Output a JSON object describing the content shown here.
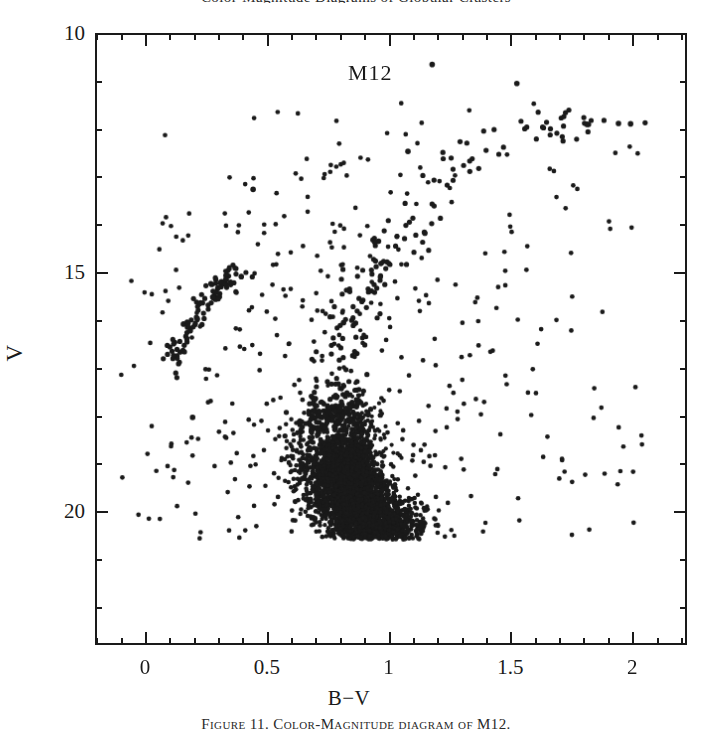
{
  "figure": {
    "caption_top": "Color-Magnitude Diagrams of Globular Clusters",
    "caption_bottom": "Figure 11. Color-Magnitude diagram of M12."
  },
  "annotations": {
    "cluster_name": "M12"
  },
  "axes": {
    "x": {
      "label": "B−V",
      "tick_labels": [
        "0",
        "0.5",
        "1",
        "1.5",
        "2"
      ],
      "tick_values": [
        0,
        0.5,
        1,
        1.5,
        2
      ],
      "minor_per_major": 5,
      "range": [
        -0.205,
        2.225
      ]
    },
    "y": {
      "label": "V",
      "tick_labels": [
        "10",
        "15",
        "20"
      ],
      "tick_values": [
        10,
        15,
        20
      ],
      "minor_per_major": 5,
      "range": [
        10.0,
        22.8
      ],
      "inverted": true
    }
  },
  "style": {
    "frame_color": "#1a1a1a",
    "point_color": "#1a1a1a",
    "background": "#ffffff",
    "point_radius": 2.6
  },
  "chart_data": {
    "type": "scatter",
    "title": "M12",
    "xlabel": "B−V",
    "ylabel": "V",
    "xlim": [
      -0.205,
      2.225
    ],
    "ylim": [
      22.8,
      10.0
    ],
    "grid": false,
    "legend": null,
    "y_axis_inverted": true,
    "populations": [
      {
        "name": "red-giant-branch",
        "n": 150,
        "note": "Narrow ridge running from the main-sequence turnoff up and to the red.",
        "ridge_points": [
          {
            "bv": 0.72,
            "v": 18.35
          },
          {
            "bv": 0.76,
            "v": 17.6
          },
          {
            "bv": 0.8,
            "v": 16.9
          },
          {
            "bv": 0.84,
            "v": 16.25
          },
          {
            "bv": 0.88,
            "v": 15.7
          },
          {
            "bv": 0.93,
            "v": 15.15
          },
          {
            "bv": 0.99,
            "v": 14.6
          },
          {
            "bv": 1.06,
            "v": 14.05
          },
          {
            "bv": 1.14,
            "v": 13.45
          },
          {
            "bv": 1.24,
            "v": 12.85
          },
          {
            "bv": 1.38,
            "v": 12.3
          },
          {
            "bv": 1.55,
            "v": 11.95
          },
          {
            "bv": 1.78,
            "v": 11.9
          },
          {
            "bv": 1.95,
            "v": 11.85
          }
        ],
        "scatter_bv": 0.055,
        "scatter_v": 0.18
      },
      {
        "name": "main-sequence",
        "n": 2600,
        "note": "Dense clump below the turnoff, truncated by the photometric limit near V = 20.6.",
        "turnoff": {
          "bv": 0.7,
          "v": 18.2
        },
        "ridge_points": [
          {
            "bv": 0.7,
            "v": 18.25
          },
          {
            "bv": 0.72,
            "v": 18.7
          },
          {
            "bv": 0.76,
            "v": 19.1
          },
          {
            "bv": 0.8,
            "v": 19.45
          },
          {
            "bv": 0.85,
            "v": 19.8
          },
          {
            "bv": 0.9,
            "v": 20.1
          },
          {
            "bv": 0.96,
            "v": 20.35
          },
          {
            "bv": 1.02,
            "v": 20.55
          }
        ],
        "scatter_bv": 0.085,
        "scatter_v": 0.3,
        "limit_v": 20.62
      },
      {
        "name": "subgiant-branch",
        "n": 110,
        "note": "Near-horizontal bridge from the turnoff to the base of the giant branch.",
        "ridge_points": [
          {
            "bv": 0.7,
            "v": 18.15
          },
          {
            "bv": 0.74,
            "v": 18.0
          },
          {
            "bv": 0.79,
            "v": 17.88
          },
          {
            "bv": 0.85,
            "v": 17.8
          }
        ],
        "scatter_bv": 0.05,
        "scatter_v": 0.16
      },
      {
        "name": "horizontal-branch",
        "n": 105,
        "note": "Blue horizontal branch; a sloping stripe toward the blue at V about 15-17.",
        "ridge_points": [
          {
            "bv": 0.095,
            "v": 16.95
          },
          {
            "bv": 0.13,
            "v": 16.55
          },
          {
            "bv": 0.17,
            "v": 16.2
          },
          {
            "bv": 0.21,
            "v": 15.85
          },
          {
            "bv": 0.25,
            "v": 15.55
          },
          {
            "bv": 0.3,
            "v": 15.3
          },
          {
            "bv": 0.345,
            "v": 15.12
          },
          {
            "bv": 0.39,
            "v": 15.02
          }
        ],
        "scatter_bv": 0.022,
        "scatter_v": 0.16
      },
      {
        "name": "asymptotic-giant-branch",
        "n": 28,
        "ridge_points": [
          {
            "bv": 0.8,
            "v": 16.2
          },
          {
            "bv": 0.88,
            "v": 15.4
          },
          {
            "bv": 0.98,
            "v": 14.6
          },
          {
            "bv": 1.1,
            "v": 13.9
          }
        ],
        "scatter_bv": 0.06,
        "scatter_v": 0.3
      },
      {
        "name": "field-stars",
        "n": 430,
        "note": "Broad halo of foreground and background contamination across the frame.",
        "bv_range": [
          -0.12,
          2.05
        ],
        "v_range": [
          11.2,
          20.6
        ]
      },
      {
        "name": "bright-outliers",
        "n": 8,
        "points": [
          {
            "bv": 1.18,
            "v": 10.62
          },
          {
            "bv": 1.53,
            "v": 11.02
          },
          {
            "bv": 1.82,
            "v": 11.88
          },
          {
            "bv": 1.95,
            "v": 11.86
          },
          {
            "bv": 2.0,
            "v": 11.87
          },
          {
            "bv": 1.08,
            "v": 12.45
          },
          {
            "bv": 0.44,
            "v": 13.25
          },
          {
            "bv": 0.19,
            "v": 18.05
          }
        ]
      }
    ],
    "total_points_approx": 3430
  }
}
